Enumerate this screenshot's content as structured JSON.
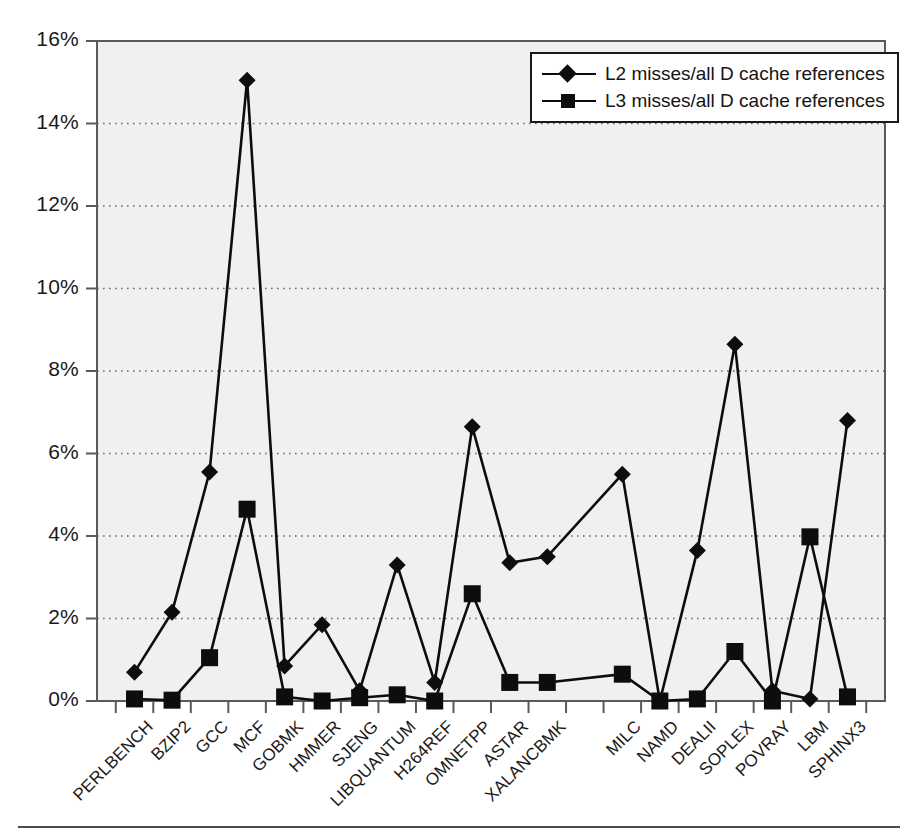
{
  "chart_data": {
    "type": "line",
    "title": "",
    "xlabel": "",
    "ylabel": "",
    "ylim": [
      0,
      16
    ],
    "ytick_labels": [
      "0%",
      "2%",
      "4%",
      "6%",
      "8%",
      "10%",
      "12%",
      "14%",
      "16%"
    ],
    "ytick_values": [
      0,
      2,
      4,
      6,
      8,
      10,
      12,
      14,
      16
    ],
    "grid": "horizontal-dotted",
    "legend_position": "top-right-inside",
    "categories": [
      "PERLBENCH",
      "BZIP2",
      "GCC",
      "MCF",
      "GOBMK",
      "HMMER",
      "SJENG",
      "LIBQUANTUM",
      "H264REF",
      "OMNETPP",
      "ASTAR",
      "XALANCBMK",
      "MILC",
      "NAMD",
      "DEALII",
      "SOPLEX",
      "POVRAY",
      "LBM",
      "SPHINX3"
    ],
    "gap_after_category": "XALANCBMK",
    "series": [
      {
        "name": "L2 misses/all D cache references",
        "marker": "diamond",
        "values": [
          0.7,
          2.15,
          5.55,
          15.05,
          0.85,
          1.85,
          0.25,
          3.3,
          0.45,
          6.65,
          3.35,
          3.5,
          5.5,
          0.0,
          3.65,
          8.65,
          0.25,
          0.05,
          6.8
        ]
      },
      {
        "name": "L3 misses/all D cache references",
        "marker": "square",
        "values": [
          0.05,
          0.02,
          1.05,
          4.65,
          0.1,
          0.0,
          0.08,
          0.15,
          0.0,
          2.6,
          0.45,
          0.45,
          0.65,
          0.0,
          0.05,
          1.2,
          0.0,
          3.98,
          0.1
        ]
      }
    ]
  },
  "style": {
    "plot_background": "#f0f0f0",
    "line_color": "#0d0d0d",
    "marker_color": "#0d0d0d",
    "axis_color": "#5a5a5a",
    "grid_color": "#6b6b6b",
    "text_color": "#1a1a1a"
  },
  "footer": {
    "rule": "horizontal-rule"
  }
}
